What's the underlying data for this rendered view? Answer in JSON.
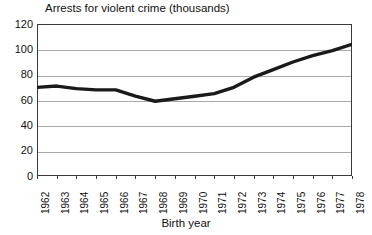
{
  "chart_data": {
    "type": "line",
    "title": "Arrests for violent crime (thousands)",
    "xlabel": "Birth year",
    "ylabel": "",
    "categories": [
      "1962",
      "1963",
      "1964",
      "1965",
      "1966",
      "1967",
      "1968",
      "1969",
      "1970",
      "1971",
      "1972",
      "1973",
      "1974",
      "1975",
      "1976",
      "1977",
      "1978"
    ],
    "values": [
      70,
      71,
      69,
      68,
      68,
      63,
      59,
      61,
      63,
      65,
      70,
      78,
      84,
      90,
      95,
      99,
      104
    ],
    "ylim": [
      0,
      120
    ],
    "yticks": [
      0,
      20,
      40,
      60,
      80,
      100,
      120
    ],
    "ytick_labels": [
      "0",
      "20",
      "40",
      "60",
      "80",
      "100",
      "120"
    ],
    "grid": true,
    "legend": "none",
    "series_color": "#1a1a1a",
    "grid_color": "#a9a9a9",
    "frame_color": "#3a3a3a"
  },
  "chart": {
    "title": "Arrests for violent crime (thousands)",
    "x_axis_title": "Birth year"
  }
}
